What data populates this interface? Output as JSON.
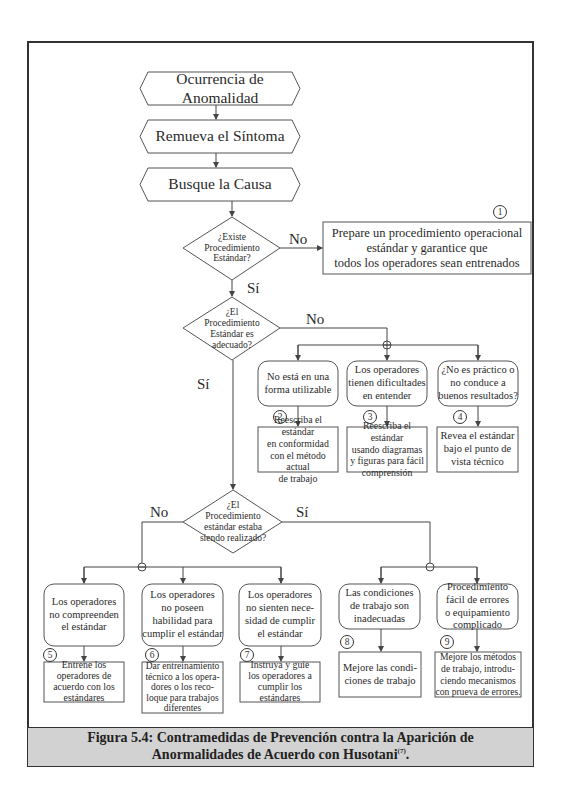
{
  "diagram": {
    "start_steps": [
      {
        "id": "hex1",
        "label": "Ocurrencia de Anomalidad"
      },
      {
        "id": "hex2",
        "label": "Remueva el Síntoma"
      },
      {
        "id": "hex3",
        "label": "Busque la Causa"
      }
    ],
    "decisions": [
      {
        "id": "d1",
        "label": "¿Existe\nProcedimiento\nEstándar?",
        "yes_label": "Sí",
        "no_label": "No"
      },
      {
        "id": "d2",
        "label": "¿El\nProcedimiento\nEstándar es\nadecuado?",
        "yes_label": "Sí",
        "no_label": "No"
      },
      {
        "id": "d3",
        "label": "¿El\nProcedimiento\nestándar estaba\nsiendo realizado?",
        "yes_label": "Sí",
        "no_label": "No"
      }
    ],
    "action_1": {
      "number": "1",
      "label": "Prepare un procedimiento operacional\nestándar y garantice que\ntodos los operadores sean entrenados"
    },
    "causes": [
      {
        "number": "2",
        "cause": "No está en una\nforma utilizable",
        "action": "Reescriba el estándar\nen conformidad\ncon el método actual\nde trabajo"
      },
      {
        "number": "3",
        "cause": "Los operadores\ntienen dificultades\nen entender",
        "action": "Reescriba el estándar\nusando diagramas\ny figuras para fácil\ncomprensión"
      },
      {
        "number": "4",
        "cause": "¿No es práctico o\nno conduce a\nbuenos resultados?",
        "action": "Revea el estándar\nbajo el punto de\nvista técnico"
      },
      {
        "number": "5",
        "cause": "Los operadores\nno compreenden\nel estándar",
        "action": "Entrene los\noperadores de\nacuerdo con los\nestándares"
      },
      {
        "number": "6",
        "cause": "Los operadores\nno poseen\nhabilidad para\ncumplir el estándar",
        "action": "Dar entreinamiento\ntécnico a los opera-\ndores o los reco-\nloque para trabajos\ndiferentes"
      },
      {
        "number": "7",
        "cause": "Los operadores\nno sienten nece-\nsidad de cumplir\nel estándar",
        "action": "Instruya y guie\nlos operadores a\ncumplir los\nestándares"
      },
      {
        "number": "8",
        "cause": "Las condiciones\nde trabajo son\ninadecuadas",
        "action": "Mejore las condi-\nciones de trabajo"
      },
      {
        "number": "9",
        "cause": "Procedimiento\nfácil de errores\no equipamiento\ncomplicado",
        "action": "Mejore los métodos\nde trabajo, introdu-\nciendo mecanismos\ncon prueva de errores."
      }
    ]
  },
  "caption": {
    "line1": "Figura 5.4: Contramedidas de Prevención contra la Aparición de",
    "line2": "Anormalidades de Acuerdo con Husotani",
    "ref": "(7)",
    "end": "."
  },
  "colors": {
    "frame": "#333333",
    "caption_bg": "#d2d2d2",
    "line": "#444444"
  }
}
